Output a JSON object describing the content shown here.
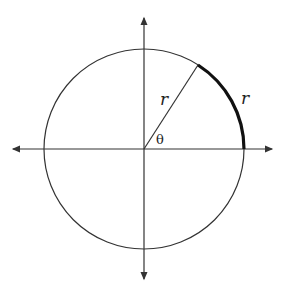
{
  "diagram": {
    "labels": {
      "radius": "r",
      "arc": "r",
      "angle": "θ"
    },
    "colors": {
      "stroke": "#333333",
      "arc_highlight": "#111111",
      "background": "#ffffff"
    },
    "geometry": {
      "center": [
        144,
        149
      ],
      "radius": 100,
      "angle_deg": 57.3
    }
  }
}
